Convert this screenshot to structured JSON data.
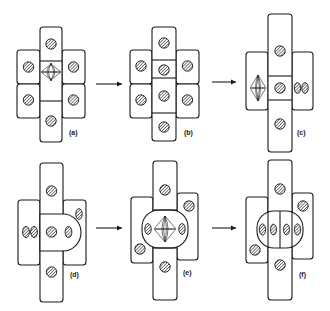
{
  "figure": {
    "panels": [
      {
        "id": "a",
        "label": "(a)"
      },
      {
        "id": "b",
        "label": "(b)"
      },
      {
        "id": "c",
        "label": "(c)"
      },
      {
        "id": "d",
        "label": "(d)"
      },
      {
        "id": "e",
        "label": "(e)"
      },
      {
        "id": "f",
        "label": "(f)"
      }
    ],
    "arrows": [
      {
        "from": "a",
        "to": "b"
      },
      {
        "from": "b",
        "to": "c"
      },
      {
        "from": "d",
        "to": "e"
      },
      {
        "from": "e",
        "to": "f"
      }
    ],
    "colors": {
      "stroke": "#1a1a1a",
      "background": "#ffffff"
    }
  }
}
